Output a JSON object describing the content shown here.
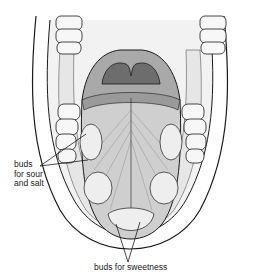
{
  "figure": {
    "labels": {
      "sour_salt_line1": "buds",
      "sour_salt_line2": "for sour",
      "sour_salt_line3": "and salt",
      "sweetness": "buds for sweetness"
    },
    "colors": {
      "line": "#1a1a1a",
      "gum": "#e6e6e6",
      "tongue": "#cfcfcf",
      "throat_dark": "#6d6d6d",
      "throat_mid": "#a9a9a9",
      "bud_region": "#eeeeee"
    }
  }
}
